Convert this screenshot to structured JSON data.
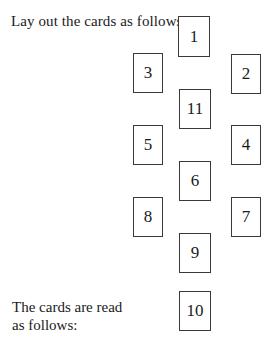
{
  "intro_text": "Lay out the cards as follows:",
  "reading_text": "The cards are read as follows:",
  "cards": [
    {
      "label": "1",
      "x": 178,
      "y": 16,
      "w": 32,
      "h": 41
    },
    {
      "label": "2",
      "x": 231,
      "y": 54,
      "w": 30,
      "h": 40
    },
    {
      "label": "3",
      "x": 133,
      "y": 53,
      "w": 30,
      "h": 40
    },
    {
      "label": "4",
      "x": 231,
      "y": 125,
      "w": 30,
      "h": 40
    },
    {
      "label": "5",
      "x": 133,
      "y": 125,
      "w": 30,
      "h": 40
    },
    {
      "label": "6",
      "x": 179,
      "y": 161,
      "w": 32,
      "h": 40
    },
    {
      "label": "7",
      "x": 231,
      "y": 197,
      "w": 30,
      "h": 40
    },
    {
      "label": "8",
      "x": 133,
      "y": 197,
      "w": 30,
      "h": 40
    },
    {
      "label": "9",
      "x": 179,
      "y": 233,
      "w": 32,
      "h": 40
    },
    {
      "label": "10",
      "x": 179,
      "y": 291,
      "w": 32,
      "h": 40
    },
    {
      "label": "11",
      "x": 179,
      "y": 89,
      "w": 32,
      "h": 40
    }
  ]
}
